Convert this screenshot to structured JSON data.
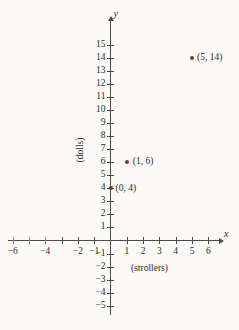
{
  "figure": {
    "background_color": "#fbfaf7",
    "axis_color": "#4a4a4a",
    "point_color": "#77371d"
  },
  "chart_data": {
    "type": "scatter",
    "title": "",
    "xlabel": "(strollers)",
    "ylabel": "(dolls)",
    "x_axis_name": "x",
    "y_axis_name": "y",
    "xlim": [
      -7,
      7
    ],
    "ylim": [
      -6,
      16
    ],
    "grid": false,
    "legend": null,
    "x": [
      0,
      1,
      5
    ],
    "y": [
      4,
      6,
      14
    ],
    "point_labels": [
      "(0, 4)",
      "(1, 6)",
      "(5, 14)"
    ],
    "points": [
      {
        "x": 0,
        "y": 4,
        "label": "(0, 4)"
      },
      {
        "x": 1,
        "y": 6,
        "label": "(1, 6)"
      },
      {
        "x": 5,
        "y": 14,
        "label": "(5, 14)"
      }
    ],
    "x_ticks": [
      -6,
      -5,
      -4,
      -3,
      -2,
      -1,
      1,
      2,
      3,
      4,
      5,
      6
    ],
    "x_tick_labels": [
      "−6",
      "",
      "−4",
      "",
      "−2",
      "−1",
      "1",
      "2",
      "3",
      "4",
      "5",
      "6"
    ],
    "y_ticks": [
      -5,
      -4,
      -3,
      -2,
      -1,
      1,
      2,
      3,
      4,
      5,
      6,
      7,
      8,
      9,
      10,
      11,
      12,
      13,
      14,
      15
    ],
    "y_tick_labels": [
      "−5",
      "−4",
      "−3",
      "−2",
      "−1",
      "1",
      "2",
      "3",
      "4",
      "5",
      "6",
      "7",
      "8",
      "9",
      "10",
      "11",
      "12",
      "13",
      "14",
      "15"
    ]
  }
}
